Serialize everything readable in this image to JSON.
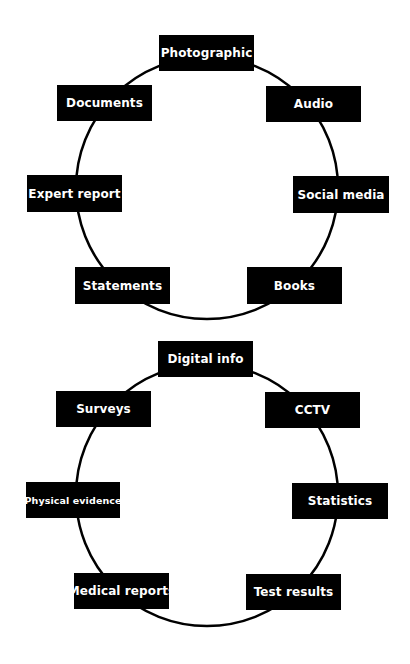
{
  "colors": {
    "background": "#ffffff",
    "node_fill": "#000000",
    "node_text": "#ffffff",
    "ring_stroke": "#000000"
  },
  "cycles": [
    {
      "name": "cycle-1",
      "ring": {
        "cx": 207,
        "cy": 188,
        "r": 131
      },
      "nodes": [
        {
          "label": "Photographic",
          "x": 159,
          "y": 35,
          "w": 95,
          "h": 36
        },
        {
          "label": "Documents",
          "x": 57,
          "y": 85,
          "w": 95,
          "h": 36
        },
        {
          "label": "Audio",
          "x": 266,
          "y": 86,
          "w": 95,
          "h": 36
        },
        {
          "label": "Expert report",
          "x": 27,
          "y": 175,
          "w": 95,
          "h": 37
        },
        {
          "label": "Social media",
          "x": 293,
          "y": 176,
          "w": 96,
          "h": 37
        },
        {
          "label": "Statements",
          "x": 75,
          "y": 267,
          "w": 95,
          "h": 37
        },
        {
          "label": "Books",
          "x": 247,
          "y": 267,
          "w": 95,
          "h": 37
        }
      ]
    },
    {
      "name": "cycle-2",
      "ring": {
        "cx": 207,
        "cy": 495,
        "r": 131
      },
      "nodes": [
        {
          "label": "Digital info",
          "x": 158,
          "y": 341,
          "w": 95,
          "h": 36
        },
        {
          "label": "Surveys",
          "x": 56,
          "y": 391,
          "w": 95,
          "h": 36
        },
        {
          "label": "CCTV",
          "x": 265,
          "y": 392,
          "w": 95,
          "h": 36
        },
        {
          "label": "Physical evidence",
          "x": 26,
          "y": 482,
          "w": 94,
          "h": 36,
          "small": true
        },
        {
          "label": "Statistics",
          "x": 292,
          "y": 483,
          "w": 96,
          "h": 36
        },
        {
          "label": "Medical reports",
          "x": 74,
          "y": 573,
          "w": 95,
          "h": 36
        },
        {
          "label": "Test results",
          "x": 246,
          "y": 574,
          "w": 95,
          "h": 36
        }
      ]
    }
  ]
}
